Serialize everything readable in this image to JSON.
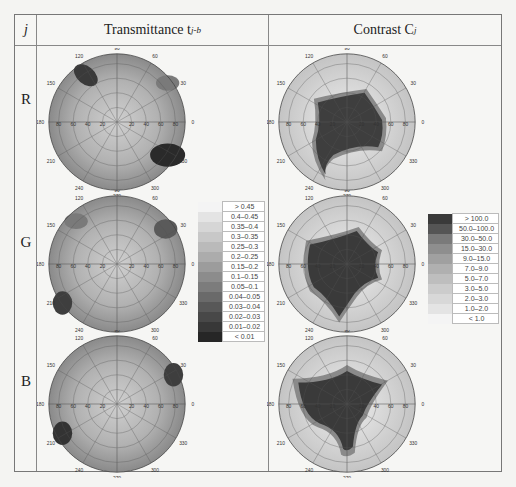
{
  "header": {
    "col_j": "j",
    "col_transmittance": "Transmittance t",
    "col_transmittance_sub": "j-b",
    "col_contrast": "Contrast C",
    "col_contrast_sub": "j"
  },
  "rows": [
    {
      "label": "R"
    },
    {
      "label": "G"
    },
    {
      "label": "B"
    }
  ],
  "polar_axes": {
    "angle_labels": [
      "0",
      "30",
      "60",
      "90",
      "120",
      "150",
      "180",
      "210",
      "240",
      "270",
      "300",
      "330"
    ],
    "radial_labels": [
      "20",
      "40",
      "60",
      "80"
    ]
  },
  "transmittance_legend": {
    "entries": [
      {
        "label": "> 0.45",
        "color": "#f4f4f4"
      },
      {
        "label": "0.4–0.45",
        "color": "#e4e4e4"
      },
      {
        "label": "0.35–0.4",
        "color": "#d6d6d6"
      },
      {
        "label": "0.3–0.35",
        "color": "#c8c8c8"
      },
      {
        "label": "0.25–0.3",
        "color": "#bababa"
      },
      {
        "label": "0.2–0.25",
        "color": "#acacac"
      },
      {
        "label": "0.15–0.2",
        "color": "#9c9c9c"
      },
      {
        "label": "0.1–0.15",
        "color": "#8c8c8c"
      },
      {
        "label": "0.05–0.1",
        "color": "#7c7c7c"
      },
      {
        "label": "0.04–0.05",
        "color": "#6a6a6a"
      },
      {
        "label": "0.03–0.04",
        "color": "#585858"
      },
      {
        "label": "0.02–0.03",
        "color": "#484848"
      },
      {
        "label": "0.01–0.02",
        "color": "#383838"
      },
      {
        "label": "< 0.01",
        "color": "#262626"
      }
    ]
  },
  "contrast_legend": {
    "entries": [
      {
        "label": "> 100.0",
        "color": "#3a3a3a"
      },
      {
        "label": "50.0–100.0",
        "color": "#555555"
      },
      {
        "label": "30.0–50.0",
        "color": "#7a7a7a"
      },
      {
        "label": "15.0–30.0",
        "color": "#8e8e8e"
      },
      {
        "label": "9.0–15.0",
        "color": "#a0a0a0"
      },
      {
        "label": "7.0–9.0",
        "color": "#b0b0b0"
      },
      {
        "label": "5.0–7.0",
        "color": "#bebebe"
      },
      {
        "label": "3.0–5.0",
        "color": "#cccccc"
      },
      {
        "label": "2.0–3.0",
        "color": "#d8d8d8"
      },
      {
        "label": "1.0–2.0",
        "color": "#e4e4e4"
      },
      {
        "label": "< 1.0",
        "color": "#f4f4f4"
      }
    ]
  }
}
